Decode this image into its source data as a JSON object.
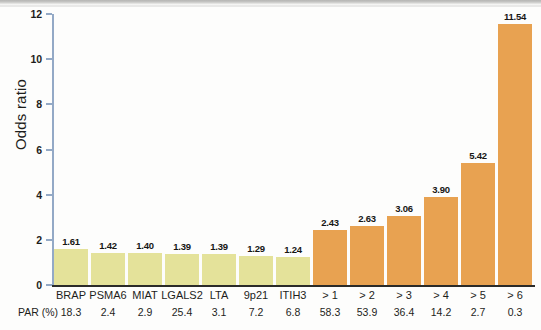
{
  "chart_data": {
    "type": "bar",
    "title": "",
    "xlabel": "",
    "ylabel": "Odds ratio",
    "ylim": [
      0,
      12
    ],
    "yticks": [
      "0",
      "2",
      "4",
      "6",
      "8",
      "10",
      "12"
    ],
    "grid": false,
    "legend": "none",
    "categories": [
      "BRAP",
      "PSMA6",
      "MIAT",
      "LGALS2",
      "LTA",
      "9p21",
      "ITIH3",
      "> 1",
      "> 2",
      "> 3",
      "> 4",
      "> 5",
      "> 6"
    ],
    "values": [
      1.61,
      1.42,
      1.4,
      1.39,
      1.39,
      1.29,
      1.24,
      2.43,
      2.63,
      3.06,
      3.9,
      5.42,
      11.54
    ],
    "value_labels": [
      "1.61",
      "1.42",
      "1.40",
      "1.39",
      "1.39",
      "1.29",
      "1.24",
      "2.43",
      "2.63",
      "3.06",
      "3.90",
      "5.42",
      "11.54"
    ],
    "bar_colors": [
      "#e4e29a",
      "#e4e29a",
      "#e4e29a",
      "#e4e29a",
      "#e4e29a",
      "#e4e29a",
      "#e4e29a",
      "#e8a251",
      "#e8a251",
      "#e8a251",
      "#e8a251",
      "#e8a251",
      "#e8a251"
    ],
    "secondary_axis": {
      "label": "PAR (%)",
      "values": [
        "18.3",
        "2.4",
        "2.9",
        "25.4",
        "3.1",
        "7.2",
        "6.8",
        "58.3",
        "53.9",
        "36.4",
        "14.2",
        "2.7",
        "0.3"
      ]
    }
  },
  "colors": {
    "single_gene_bar": "#e4e29a",
    "combined_risk_bar": "#e8a251",
    "axis_line": "#93a9c6",
    "baseline": "#2b2b29",
    "text": "#1d1d1b"
  }
}
